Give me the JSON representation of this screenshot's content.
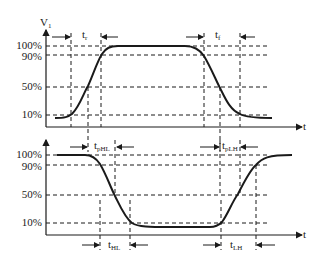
{
  "diagram": {
    "type": "timing-diagram",
    "top": {
      "y_axis_label": "V",
      "y_axis_label_sub": "1",
      "x_axis_label": "t",
      "levels": [
        "100%",
        "90%",
        "50%",
        "10%"
      ],
      "rise_label": "t",
      "rise_label_sub": "r",
      "fall_label": "t",
      "fall_label_sub": "f"
    },
    "bottom": {
      "x_axis_label": "t",
      "levels": [
        "100%",
        "90%",
        "50%",
        "10%"
      ],
      "tphl_label": "t",
      "tphl_sub": "pHL",
      "tplh_label": "t",
      "tplh_sub": "pLH",
      "thl_label": "t",
      "thl_sub": "HL",
      "tlh_label": "t",
      "tlh_sub": "LH"
    }
  }
}
